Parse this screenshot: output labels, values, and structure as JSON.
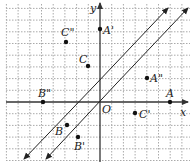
{
  "diagram": {
    "type": "coordinate-grid",
    "axes": {
      "x_label": "x",
      "y_label": "y",
      "origin_label": "O"
    },
    "grid": {
      "x_range": [
        -8,
        7
      ],
      "y_range": [
        -4,
        8
      ],
      "cell_px": 11.7,
      "origin_px": [
        100,
        102
      ]
    },
    "points": [
      {
        "label": "A",
        "x": 6,
        "y": 0
      },
      {
        "label": "A'",
        "x": 0,
        "y": 6
      },
      {
        "label": "A\"",
        "x": 4,
        "y": 2
      },
      {
        "label": "B",
        "x": -3,
        "y": -2
      },
      {
        "label": "B'",
        "x": -2,
        "y": -3
      },
      {
        "label": "B\"",
        "x": -5,
        "y": 0
      },
      {
        "label": "C",
        "x": -1,
        "y": 3
      },
      {
        "label": "C'",
        "x": 3,
        "y": -1
      },
      {
        "label": "C\"",
        "x": -3,
        "y": 5
      }
    ],
    "lines": [
      {
        "name": "line-1",
        "description": "double-headed arrow line, slope 1"
      },
      {
        "name": "line-2",
        "description": "double-headed arrow line, slope 1, offset right"
      }
    ],
    "colors": {
      "grid": "#999999",
      "axis": "#333333",
      "ink": "#222222"
    }
  }
}
